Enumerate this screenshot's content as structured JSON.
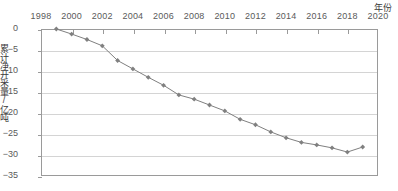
{
  "chart_data": {
    "type": "line",
    "title": "",
    "subtitle": "",
    "xlabel": "年份",
    "ylabel": "累计净开采量/亿吨",
    "xlim": [
      1998,
      2020
    ],
    "ylim": [
      -35,
      0
    ],
    "xticks": [
      1998,
      2000,
      2002,
      2004,
      2006,
      2008,
      2010,
      2012,
      2014,
      2016,
      2018,
      2020
    ],
    "yticks": [
      0,
      -5,
      -10,
      -15,
      -20,
      -25,
      -30,
      -35
    ],
    "xtick_labels": [
      "1998",
      "2000",
      "2002",
      "2004",
      "2006",
      "2008",
      "2010",
      "2012",
      "2014",
      "2016",
      "2018",
      "2020"
    ],
    "ytick_labels": [
      "0",
      "-5",
      "-10",
      "-15",
      "-20",
      "-25",
      "-30",
      "-35"
    ],
    "grid": "horizontal",
    "legend": "none",
    "series": [
      {
        "name": "累计净开采量",
        "color": "#808080",
        "marker": "diamond",
        "x": [
          1999,
          2000,
          2001,
          2002,
          2003,
          2004,
          2005,
          2006,
          2007,
          2008,
          2009,
          2010,
          2011,
          2012,
          2013,
          2014,
          2015,
          2016,
          2017,
          2018,
          2019
        ],
        "values": [
          0.0,
          -1.2,
          -2.5,
          -4.0,
          -7.5,
          -9.5,
          -11.5,
          -13.4,
          -15.7,
          -16.7,
          -18.1,
          -19.5,
          -21.5,
          -22.8,
          -24.5,
          -25.9,
          -27.0,
          -27.6,
          -28.3,
          -29.3,
          -28.1
        ]
      }
    ],
    "colors": {
      "series": "#808080",
      "axis": "#9a9a9a",
      "grid": "#d4d4d4",
      "text": "#5a5a5a",
      "background": "#ffffff"
    }
  }
}
